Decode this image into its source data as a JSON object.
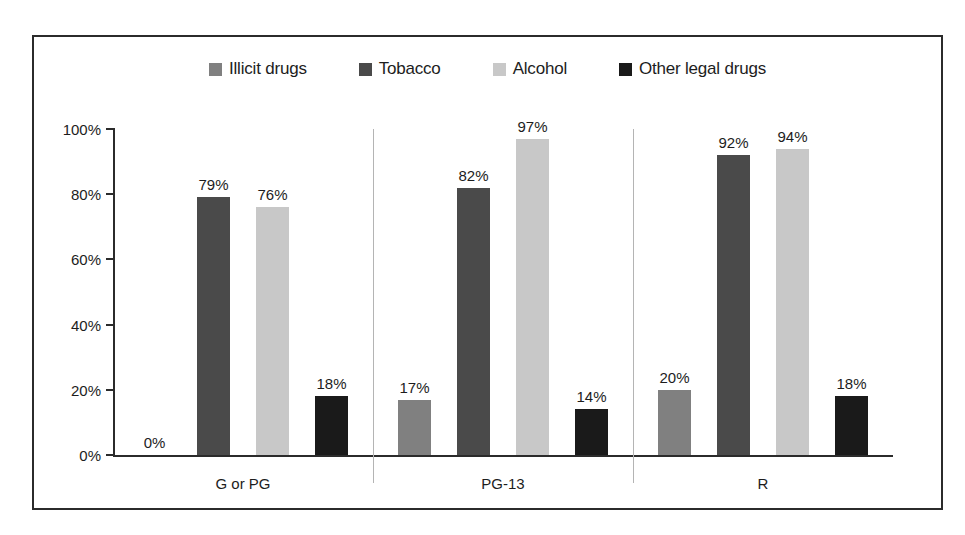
{
  "chart_data": {
    "type": "bar",
    "title": "",
    "subtitle": "",
    "xlabel": "",
    "ylabel": "",
    "categories": [
      "G or PG",
      "PG-13",
      "R"
    ],
    "series": [
      {
        "name": "Illicit drugs",
        "color": "#808080",
        "values": [
          0,
          17,
          20
        ],
        "labels": [
          "0%",
          "17%",
          "20%"
        ]
      },
      {
        "name": "Tobacco",
        "color": "#4a4a4a",
        "values": [
          79,
          82,
          92
        ],
        "labels": [
          "79%",
          "82%",
          "92%"
        ]
      },
      {
        "name": "Alcohol",
        "color": "#c8c8c8",
        "values": [
          76,
          97,
          94
        ],
        "labels": [
          "76%",
          "97%",
          "94%"
        ]
      },
      {
        "name": "Other legal drugs",
        "color": "#1a1a1a",
        "values": [
          18,
          14,
          18
        ],
        "labels": [
          "18%",
          "14%",
          "18%"
        ]
      }
    ],
    "ylim": [
      0,
      100
    ],
    "yticks": [
      0,
      20,
      40,
      60,
      80,
      100
    ],
    "ytick_labels": [
      "0%",
      "20%",
      "40%",
      "60%",
      "80%",
      "100%"
    ],
    "grid": false,
    "legend_position": "top",
    "value_labels_shown": true,
    "group_separators": true,
    "frame": "#2b2b2b",
    "background": "#ffffff"
  },
  "legend": {
    "items": [
      {
        "label": "Illicit drugs",
        "color": "#808080"
      },
      {
        "label": "Tobacco",
        "color": "#4a4a4a"
      },
      {
        "label": "Alcohol",
        "color": "#c8c8c8"
      },
      {
        "label": "Other legal drugs",
        "color": "#1a1a1a"
      }
    ]
  }
}
